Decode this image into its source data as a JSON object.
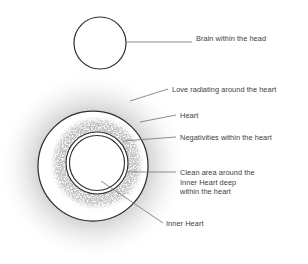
{
  "diagram": {
    "background_color": "#ffffff",
    "text_color": "#3d3d3d",
    "line_color": "#7a7a7a",
    "stroke_color": "#333333",
    "glow_color": "#8e8e8e",
    "speckle_color": "#8a8a8a"
  },
  "labels": {
    "brain": "Brain within the head",
    "love": "Love radiating around the heart",
    "heart": "Heart",
    "negativities": "Negativities within the heart",
    "clean_area": "Clean area around the\nInner Heart deep\nwithin the heart",
    "inner_heart": "Inner Heart"
  },
  "shapes": {
    "brain_circle": {
      "name": "brain-circle",
      "cx": 100,
      "cy": 43,
      "r": 26
    },
    "heart_circle": {
      "name": "heart-circle",
      "cx": 93,
      "cy": 166,
      "r": 55
    },
    "negativities_ring": {
      "name": "negativities-ring",
      "cx": 97,
      "cy": 163,
      "r_outer": 46,
      "r_inner": 32
    },
    "inner_heart_outer": {
      "name": "inner-heart-outer-ring",
      "cx": 97,
      "cy": 163,
      "r": 31
    },
    "inner_heart_inner": {
      "name": "inner-heart-inner-ring",
      "cx": 97,
      "cy": 163,
      "r": 28
    },
    "love_glow": {
      "name": "love-glow",
      "cx": 93,
      "cy": 166,
      "r": 95
    }
  },
  "leaders": {
    "brain": {
      "x1": 126,
      "y1": 42,
      "x2": 192,
      "y2": 42
    },
    "love": {
      "x1": 130,
      "y1": 101,
      "x2": 168,
      "y2": 89
    },
    "heart": {
      "x1": 140,
      "y1": 122,
      "x2": 176,
      "y2": 115
    },
    "negativities": {
      "x1": 123,
      "y1": 141,
      "x2": 176,
      "y2": 137
    },
    "clean_area": {
      "x1": 126,
      "y1": 172,
      "x2": 176,
      "y2": 172
    },
    "inner_heart": {
      "x1": 101,
      "y1": 181,
      "x2": 163,
      "y2": 223
    }
  }
}
